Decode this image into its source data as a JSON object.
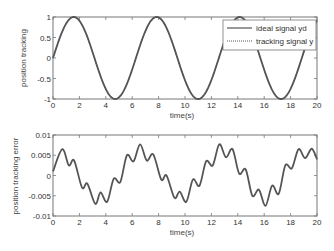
{
  "chart_data": [
    {
      "type": "line",
      "title": "",
      "xlabel": "time(s)",
      "ylabel": "position tracking",
      "xlim": [
        0,
        20
      ],
      "ylim": [
        -1,
        1
      ],
      "xticks": [
        0,
        2,
        4,
        6,
        8,
        10,
        12,
        14,
        16,
        18,
        20
      ],
      "yticks": [
        -1,
        -0.5,
        0,
        0.5,
        1
      ],
      "ytick_labels": [
        "-1",
        "-0.5",
        "0",
        "0.5",
        "1"
      ],
      "grid": false,
      "legend_position": "upper right",
      "legend": [
        "ideal signal yd",
        "tracking signal y"
      ],
      "series": [
        {
          "name": "ideal signal yd",
          "style": "solid",
          "function": "sin(t)",
          "x": [
            0,
            1.57,
            3.14,
            4.71,
            6.28,
            7.85,
            9.42,
            11.0,
            12.57,
            14.14,
            15.71,
            17.28,
            18.85,
            20
          ],
          "values": [
            0,
            1,
            0,
            -1,
            0,
            1,
            0,
            -1,
            0,
            1,
            0,
            -1,
            0,
            0.91
          ]
        },
        {
          "name": "tracking signal y",
          "style": "dotted",
          "function": "sin(t) - e(t)",
          "x": [
            0,
            1.57,
            3.14,
            4.71,
            6.28,
            7.85,
            9.42,
            11.0,
            12.57,
            14.14,
            15.71,
            17.28,
            18.85,
            20
          ],
          "values": [
            0,
            1,
            0,
            -1,
            0,
            1,
            0,
            -1,
            0,
            1,
            0,
            -1,
            0,
            0.91
          ]
        }
      ]
    },
    {
      "type": "line",
      "title": "",
      "xlabel": "time(s)",
      "ylabel": "position tracking error",
      "xlim": [
        0,
        20
      ],
      "ylim": [
        -0.01,
        0.01
      ],
      "xticks": [
        0,
        2,
        4,
        6,
        8,
        10,
        12,
        14,
        16,
        18,
        20
      ],
      "yticks": [
        -0.01,
        -0.005,
        0,
        0.005,
        0.01
      ],
      "ytick_labels": [
        "-0.01",
        "-0.005",
        "0",
        "0.005",
        "0.01"
      ],
      "grid": false,
      "series": [
        {
          "name": "position tracking error",
          "x": [
            0,
            0.7,
            1.2,
            1.6,
            2.2,
            2.6,
            3.2,
            3.6,
            4.1,
            4.6,
            5.1,
            5.6,
            6.1,
            6.6,
            7.1,
            7.6,
            8.2,
            8.6,
            9.2,
            9.6,
            10.1,
            10.6,
            11.1,
            11.6,
            12.1,
            12.6,
            13.1,
            13.6,
            14.1,
            14.6,
            15.1,
            15.6,
            16.1,
            16.6,
            17.1,
            17.6,
            18.1,
            18.6,
            19.1,
            19.6,
            20
          ],
          "values": [
            0.001,
            0.0065,
            0.0025,
            0.0037,
            -0.003,
            -0.002,
            -0.007,
            -0.0042,
            -0.0065,
            -0.0008,
            -0.0016,
            0.005,
            0.0035,
            0.0077,
            0.0037,
            0.0052,
            -0.001,
            0.0,
            -0.0055,
            -0.004,
            -0.0065,
            -0.001,
            -0.0025,
            0.0035,
            0.0025,
            0.0077,
            0.0045,
            0.0065,
            0.0005,
            0.0015,
            -0.005,
            -0.0035,
            -0.0075,
            -0.0025,
            -0.0045,
            0.0025,
            0.0018,
            0.0065,
            0.0043,
            0.0066,
            0.004
          ]
        }
      ]
    }
  ],
  "labels": {
    "top_ylabel": "position tracking",
    "top_xlabel": "time(s)",
    "bottom_ylabel": "position tracking error",
    "bottom_xlabel": "time(s)",
    "legend_ideal": "ideal signal yd",
    "legend_tracking": "tracking signal y"
  },
  "colors": {
    "line": "#555555",
    "axes": "#666666",
    "text": "#333333"
  }
}
